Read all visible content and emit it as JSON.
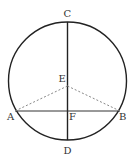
{
  "diagram": {
    "type": "circle-geometry",
    "stroke_color": "#222222",
    "dash_color": "#888888",
    "circle": {
      "cx": 67.5,
      "cy": 81,
      "r": 59
    },
    "points": {
      "C": {
        "label": "C",
        "x": 67.5,
        "y": 22
      },
      "D": {
        "label": "D",
        "x": 67.5,
        "y": 140
      },
      "E": {
        "label": "E",
        "x": 67.5,
        "y": 86
      },
      "F": {
        "label": "F",
        "x": 67.5,
        "y": 111
      },
      "A": {
        "label": "A",
        "x": 15,
        "y": 111
      },
      "B": {
        "label": "B",
        "x": 120,
        "y": 111
      }
    },
    "segments": [
      {
        "from": "C",
        "to": "D",
        "style": "solid"
      },
      {
        "from": "A",
        "to": "B",
        "style": "solid"
      },
      {
        "from": "E",
        "to": "A",
        "style": "dashed"
      },
      {
        "from": "E",
        "to": "B",
        "style": "dashed"
      }
    ]
  }
}
